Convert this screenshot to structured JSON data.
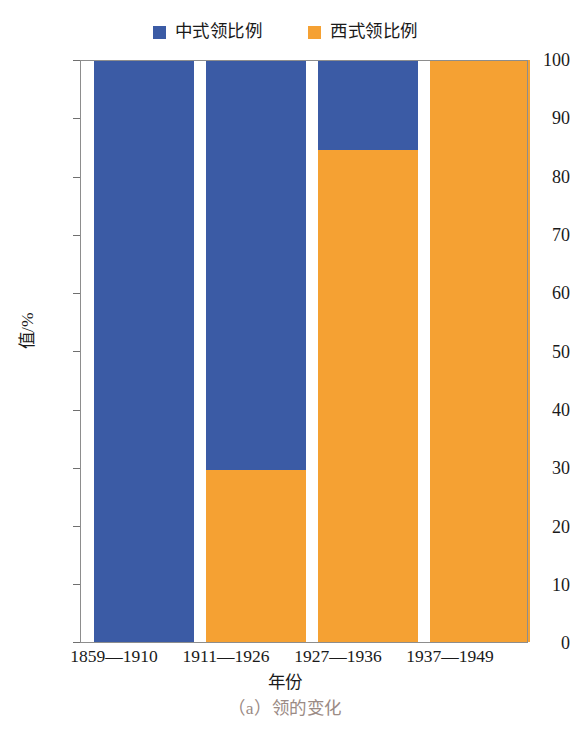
{
  "chart_data": {
    "type": "bar",
    "subtype": "stacked-100-percent",
    "title": "",
    "caption": "（a）领的变化",
    "xlabel": "年份",
    "ylabel": "值/%",
    "categories": [
      "1859—1910",
      "1911—1926",
      "1927—1936",
      "1937—1949"
    ],
    "series": [
      {
        "name": "中式领比例",
        "color": "#3b5ba5",
        "values": [
          100,
          70.5,
          15.5,
          0
        ]
      },
      {
        "name": "西式领比例",
        "color": "#f5a133",
        "values": [
          0,
          29.5,
          84.5,
          100
        ]
      }
    ],
    "ylim": [
      0,
      100
    ],
    "ytick_labels": [
      "100",
      "90",
      "80",
      "70",
      "60",
      "50",
      "40",
      "30",
      "20",
      "10",
      "0"
    ],
    "ytick_values": [
      100,
      90,
      80,
      70,
      60,
      50,
      40,
      30,
      20,
      10,
      0
    ],
    "grid": true,
    "grid_axis": "y",
    "legend": {
      "position": "top-center",
      "entries": [
        {
          "label": "中式领比例",
          "color": "#3b5ba5",
          "marker": "square"
        },
        {
          "label": "西式领比例",
          "color": "#f5a133",
          "marker": "square"
        }
      ]
    },
    "colors": {
      "blue": "#3b5ba5",
      "orange": "#f5a133",
      "axis": "#8d8d8d",
      "grid": "#b9b9b9",
      "caption": "#9b8b85",
      "background": "#ffffff"
    }
  }
}
